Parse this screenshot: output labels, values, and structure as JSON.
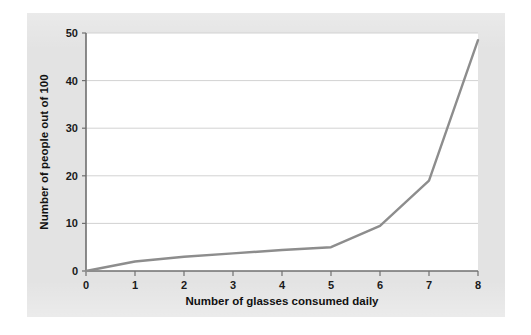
{
  "figure": {
    "background_color": "#ffffff",
    "panel_color": "#e3e3e3",
    "plot_background_color": "#ffffff",
    "axis_color": "#6f6f6f",
    "gridline_color": "#d2d2d2",
    "line_color": "#8d8d8d",
    "text_color": "#111111"
  },
  "chart_data": {
    "type": "line",
    "title": "",
    "subtitle": "",
    "xlabel": "Number of glasses consumed daily",
    "ylabel": "Number of people out of 100",
    "x": [
      0,
      1,
      2,
      3,
      4,
      5,
      6,
      7,
      8
    ],
    "values": [
      0,
      2,
      3,
      3.7,
      4.4,
      5,
      9.5,
      19,
      48.5
    ],
    "series": [
      {
        "name": "Number of people out of 100",
        "values": [
          0,
          2,
          3,
          3.7,
          4.4,
          5,
          9.5,
          19,
          48.5
        ]
      }
    ],
    "xlim": [
      0,
      8
    ],
    "ylim": [
      0,
      50
    ],
    "xticks": [
      0,
      1,
      2,
      3,
      4,
      5,
      6,
      7,
      8
    ],
    "yticks": [
      0,
      10,
      20,
      30,
      40,
      50
    ],
    "xtick_labels": [
      "0",
      "1",
      "2",
      "3",
      "4",
      "5",
      "6",
      "7",
      "8"
    ],
    "ytick_labels": [
      "0",
      "10",
      "20",
      "30",
      "40",
      "50"
    ],
    "grid": "horizontal",
    "legend": "none",
    "annotations": []
  }
}
